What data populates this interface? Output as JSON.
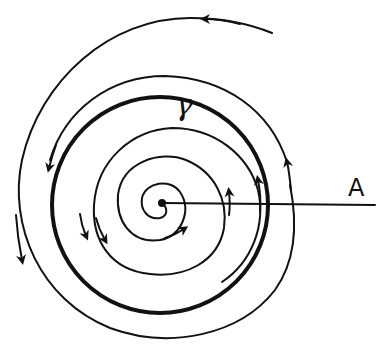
{
  "diagram": {
    "type": "phase-portrait",
    "labels": {
      "limit_cycle": "γ",
      "transversal": "A"
    },
    "elements": {
      "limit_cycle": {
        "name": "γ",
        "style": "thick closed orbit",
        "direction": "counterclockwise"
      },
      "outer_trajectory": {
        "behavior": "spirals inward toward γ",
        "direction": "counterclockwise"
      },
      "inner_trajectory": {
        "behavior": "spirals outward from equilibrium toward γ",
        "direction": "counterclockwise"
      },
      "equilibrium": {
        "style": "dot at center"
      },
      "transversal_segment": {
        "name": "A",
        "from": "equilibrium",
        "to": "right edge"
      }
    },
    "colors": {
      "ink": "#111111",
      "background": "#ffffff"
    }
  }
}
